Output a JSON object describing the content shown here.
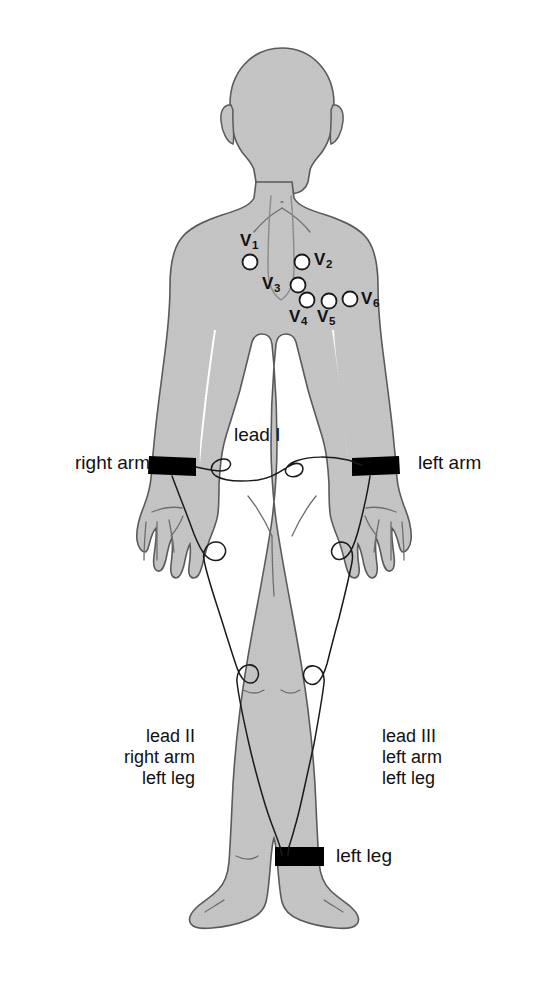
{
  "colors": {
    "body_fill": "#c4c4c4",
    "body_outline": "#5a5a5a",
    "band_fill": "#000000",
    "wire": "#1a1a1a",
    "electrode_fill": "#ffffff",
    "electrode_outline": "#1a1a1a",
    "text": "#111111",
    "background": "#ffffff"
  },
  "chest_electrodes": [
    {
      "id": "v1",
      "label": "V",
      "sub": "1",
      "cx": 250,
      "cy": 262,
      "r": 7.5,
      "label_x": 240,
      "label_y": 231
    },
    {
      "id": "v2",
      "label": "V",
      "sub": "2",
      "cx": 302,
      "cy": 262,
      "r": 7.5,
      "label_x": 314,
      "label_y": 250
    },
    {
      "id": "v3",
      "label": "V",
      "sub": "3",
      "cx": 298,
      "cy": 285,
      "r": 7.5,
      "label_x": 262,
      "label_y": 274
    },
    {
      "id": "v4",
      "label": "V",
      "sub": "4",
      "cx": 307,
      "cy": 300,
      "r": 7.5,
      "label_x": 289,
      "label_y": 307
    },
    {
      "id": "v5",
      "label": "V",
      "sub": "5",
      "cx": 329,
      "cy": 301,
      "r": 7.5,
      "label_x": 317,
      "label_y": 307
    },
    {
      "id": "v6",
      "label": "V",
      "sub": "6",
      "cx": 350,
      "cy": 299,
      "r": 7.5,
      "label_x": 361,
      "label_y": 289
    }
  ],
  "labels": {
    "right_arm": "right arm",
    "left_arm": "left arm",
    "lead_i": "lead I",
    "left_leg": "left leg",
    "lead_ii": {
      "line1": "lead II",
      "line2": "right arm",
      "line3": "left leg"
    },
    "lead_iii": {
      "line1": "lead III",
      "line2": "left arm",
      "line3": "left leg"
    }
  },
  "bands": [
    {
      "id": "right-wrist-band",
      "label": "right arm electrode band"
    },
    {
      "id": "left-wrist-band",
      "label": "left arm electrode band"
    },
    {
      "id": "left-ankle-band",
      "label": "left leg electrode band"
    }
  ]
}
